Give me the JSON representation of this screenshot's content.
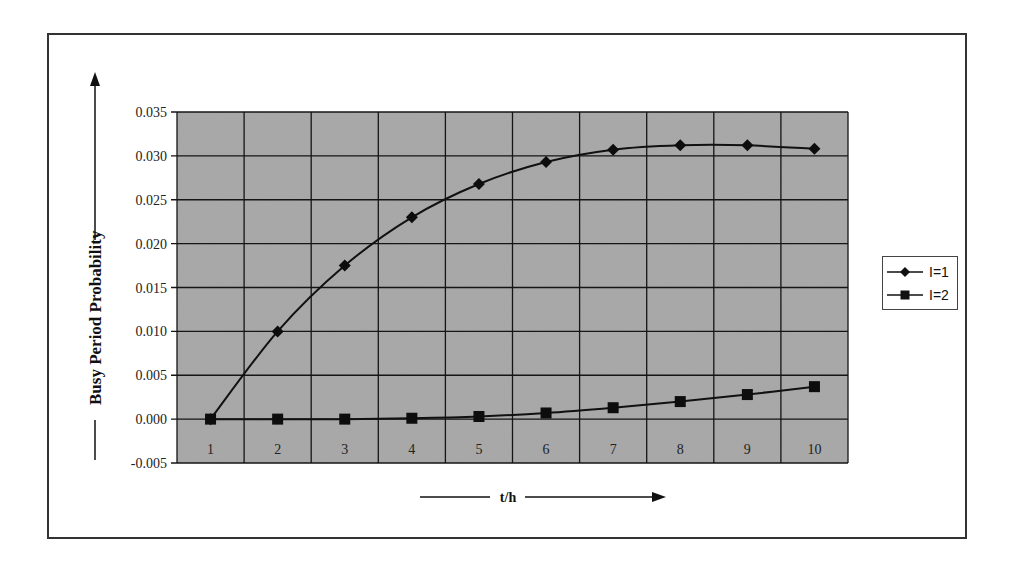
{
  "chart_data": {
    "type": "line",
    "title": "",
    "xlabel": "t/h",
    "ylabel": "Busy Period Probability",
    "categories": [
      "1",
      "2",
      "3",
      "4",
      "5",
      "6",
      "7",
      "8",
      "9",
      "10"
    ],
    "y_ticks": [
      "0.035",
      "0.030",
      "0.025",
      "0.020",
      "0.015",
      "0.010",
      "0.005",
      "0.000",
      "-0.005"
    ],
    "ylim": [
      -0.005,
      0.035
    ],
    "grid": true,
    "legend_position": "right",
    "series": [
      {
        "name": "I=1",
        "marker": "diamond",
        "values": [
          0.0,
          0.01,
          0.0175,
          0.023,
          0.0268,
          0.0293,
          0.0307,
          0.0312,
          0.0312,
          0.0308
        ]
      },
      {
        "name": "I=2",
        "marker": "square",
        "values": [
          0.0,
          0.0,
          0.0,
          0.0001,
          0.0003,
          0.0007,
          0.0013,
          0.002,
          0.0028,
          0.0037
        ]
      }
    ]
  },
  "legend": {
    "items": [
      {
        "label": "I=1"
      },
      {
        "label": "I=2"
      }
    ]
  }
}
